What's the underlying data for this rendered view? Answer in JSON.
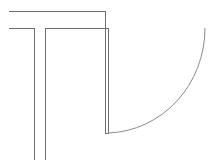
{
  "diagram": {
    "type": "architectural-floor-plan-fragment",
    "stroke_color": "#6e6e6e",
    "arc_color": "#8a8a8a",
    "background": "#ffffff",
    "elements": {
      "wall_top_outer": {
        "x1": 9,
        "y1": 11,
        "x2": 105,
        "y2": 11
      },
      "wall_top_inner": {
        "x1": 9,
        "y1": 28,
        "x2": 108,
        "y2": 28
      },
      "wall_left_pier_gap_left": {
        "x1": 34,
        "y1": 28,
        "x2": 34,
        "y2": 160
      },
      "wall_left_pier_gap_right": {
        "x1": 45,
        "y1": 28,
        "x2": 45,
        "y2": 160
      },
      "door_leaf_outer": {
        "x1": 105,
        "y1": 11,
        "x2": 105,
        "y2": 133
      },
      "door_leaf_inner": {
        "x1": 108,
        "y1": 28,
        "x2": 108,
        "y2": 133
      },
      "door_leaf_bottom": {
        "x1": 105,
        "y1": 133,
        "x2": 108,
        "y2": 133
      },
      "door_swing_arc": {
        "start": [
          108,
          133
        ],
        "end": [
          205,
          28
        ],
        "radius": 105
      }
    }
  }
}
